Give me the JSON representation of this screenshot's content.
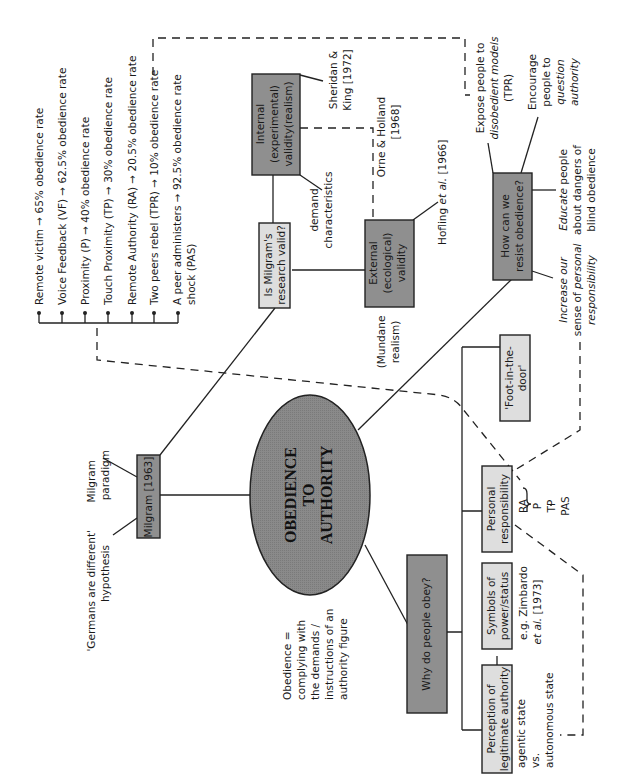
{
  "diagram": {
    "central_node": [
      "OBEDIENCE",
      "TO",
      "AUTHORITY"
    ],
    "definition": [
      "Obedience =",
      "complying with",
      "the demands /",
      "instructions of an",
      "authority figure"
    ],
    "milgram": {
      "label": "Milgram [1963]",
      "notes": {
        "paradigm": [
          "Milgram",
          "paradigm"
        ],
        "germans": [
          "'Germans are different'",
          "hypothesis"
        ]
      }
    },
    "variations": [
      {
        "text": "Remote victim → 65% obedience rate"
      },
      {
        "text": "Voice Feedback (VF) → 62.5% obedience rate"
      },
      {
        "text": "Proximity (P) → 40% obedience rate"
      },
      {
        "text": "Touch Proximity (TP) → 30% obedience rate"
      },
      {
        "text": "Remote Authority (RA) → 20.5% obedience rate"
      },
      {
        "text": "Two peers rebel (TPR) → 10% obedience rate"
      },
      {
        "text": "A peer administers → 92.5% obedience rate",
        "text2": "shock (PAS)"
      }
    ],
    "validity": {
      "question": [
        "Is Milgram's",
        "research valid?"
      ],
      "internal": [
        "Internal",
        "(experimental)",
        "validity(realism)"
      ],
      "external": [
        "External",
        "(ecological)",
        "validity"
      ],
      "sheridan": [
        "Sheridan &",
        "King [1972]"
      ],
      "demand": [
        "demand",
        "characteristics"
      ],
      "orne": [
        "Orne & Holland",
        "[1968]"
      ],
      "hofling_a": "Hofling ",
      "hofling_b": "et al.",
      "hofling_c": " [1966]",
      "mundane": [
        "(Mundane",
        "realism)"
      ]
    },
    "resist": {
      "question": [
        "How can we",
        "resist obedience?"
      ],
      "expose": {
        "l1": "Expose people to",
        "l2": "disobedient models",
        "l3": "(TPR)"
      },
      "encourage": {
        "l1": "Encourage",
        "l2": "people to",
        "l3": "question",
        "l4": "authority"
      },
      "educate": {
        "l1": "Educate",
        "l1b": " people",
        "l2": "about dangers of",
        "l3": "blind obedience"
      },
      "increase": {
        "l1": "Increase our",
        "l2a": "sense of ",
        "l2b": "personal",
        "l3": "responsibility"
      }
    },
    "why_obey": {
      "question": "Why do people obey?",
      "foot": [
        "'Foot-in-the-",
        "door'"
      ],
      "personal": [
        "Personal",
        "responsibility"
      ],
      "personal_refs": [
        "RA",
        "P",
        "TP",
        "PAS"
      ],
      "symbols": [
        "Symbols of",
        "power/status"
      ],
      "zimbardo_a": "e.g. Zimbardo",
      "zimbardo_b": "et al.",
      "zimbardo_c": " [1973]",
      "perception": [
        "Perception of",
        "legitimate authority"
      ],
      "states": [
        "agentic state",
        "vs.",
        "autonomous state"
      ]
    }
  }
}
